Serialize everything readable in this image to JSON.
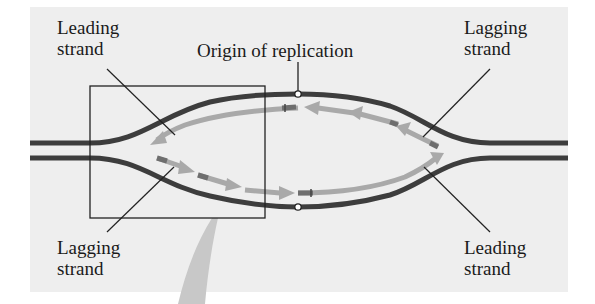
{
  "figure": {
    "labels": {
      "top_left": {
        "line1": "Leading",
        "line2": "strand"
      },
      "top_right": {
        "line1": "Lagging",
        "line2": "strand"
      },
      "bottom_left": {
        "line1": "Lagging",
        "line2": "strand"
      },
      "bottom_right": {
        "line1": "Leading",
        "line2": "strand"
      },
      "origin": "Origin of replication"
    },
    "colors": {
      "background_panel": "#eeeeee",
      "parental_strand": "#3d3d3d",
      "new_strand": "#a9a9a9",
      "primer": "#6e6e6e",
      "callout_arrow": "#c8c8c8",
      "zoom_box": "#222222"
    },
    "elements": {
      "parental_strands": 2,
      "leading_strands": 2,
      "lagging_fragments_per_side": 3,
      "zoom_box": "left fork highlighted by rectangle with callout arrow below"
    }
  }
}
